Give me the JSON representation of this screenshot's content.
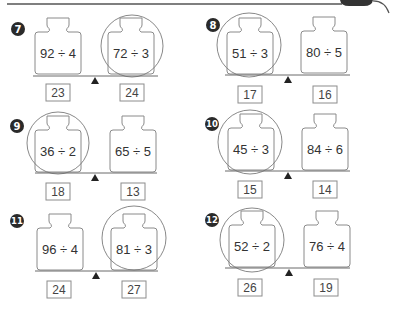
{
  "colors": {
    "badge": "#2a2a2a",
    "outline": "#8a8a8a",
    "text": "#333333",
    "fulcrum": "#222222"
  },
  "problems": [
    {
      "number": "7",
      "left": {
        "expression": "92 ÷ 4",
        "answer": "23"
      },
      "right": {
        "expression": "72 ÷ 3",
        "answer": "24"
      },
      "circled": "right"
    },
    {
      "number": "8",
      "left": {
        "expression": "51 ÷ 3",
        "answer": "17"
      },
      "right": {
        "expression": "80 ÷ 5",
        "answer": "16"
      },
      "circled": "left"
    },
    {
      "number": "9",
      "left": {
        "expression": "36 ÷ 2",
        "answer": "18"
      },
      "right": {
        "expression": "65 ÷ 5",
        "answer": "13"
      },
      "circled": "left"
    },
    {
      "number": "10",
      "left": {
        "expression": "45 ÷ 3",
        "answer": "15"
      },
      "right": {
        "expression": "84 ÷ 6",
        "answer": "14"
      },
      "circled": "left"
    },
    {
      "number": "11",
      "left": {
        "expression": "96 ÷ 4",
        "answer": "24"
      },
      "right": {
        "expression": "81 ÷ 3",
        "answer": "27"
      },
      "circled": "right"
    },
    {
      "number": "12",
      "left": {
        "expression": "52 ÷ 2",
        "answer": "26"
      },
      "right": {
        "expression": "76 ÷ 4",
        "answer": "19"
      },
      "circled": "left"
    }
  ]
}
